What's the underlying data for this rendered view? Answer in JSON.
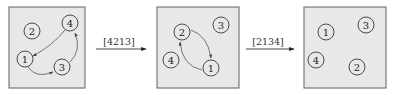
{
  "colors": {
    "box_fill": "#e8e8e8",
    "box_border": "#6e6e6e",
    "circle_stroke": "#3a3a3a",
    "arrow": "#555555"
  },
  "panels": [
    {
      "id": "state-1",
      "nodes": [
        {
          "label": "1",
          "x": 25,
          "y": 59
        },
        {
          "label": "2",
          "x": 32,
          "y": 31
        },
        {
          "label": "3",
          "x": 62,
          "y": 67
        },
        {
          "label": "4",
          "x": 70,
          "y": 23
        }
      ],
      "edges": [
        {
          "from": "4",
          "to": "1"
        },
        {
          "from": "1",
          "to": "3"
        },
        {
          "from": "3",
          "to": "4"
        }
      ]
    },
    {
      "id": "state-2",
      "nodes": [
        {
          "label": "2",
          "x": 182,
          "y": 32
        },
        {
          "label": "3",
          "x": 221,
          "y": 25
        },
        {
          "label": "4",
          "x": 171,
          "y": 60
        },
        {
          "label": "1",
          "x": 211,
          "y": 68
        }
      ],
      "edges": [
        {
          "from": "2",
          "to": "1"
        },
        {
          "from": "1",
          "to": "2"
        }
      ]
    },
    {
      "id": "state-3",
      "nodes": [
        {
          "label": "1",
          "x": 326,
          "y": 32
        },
        {
          "label": "3",
          "x": 366,
          "y": 25
        },
        {
          "label": "4",
          "x": 316,
          "y": 60
        },
        {
          "label": "2",
          "x": 357,
          "y": 67
        }
      ],
      "edges": []
    }
  ],
  "transitions": [
    {
      "label": "[4213]",
      "from": "state-1",
      "to": "state-2"
    },
    {
      "label": "[2134]",
      "from": "state-2",
      "to": "state-3"
    }
  ]
}
